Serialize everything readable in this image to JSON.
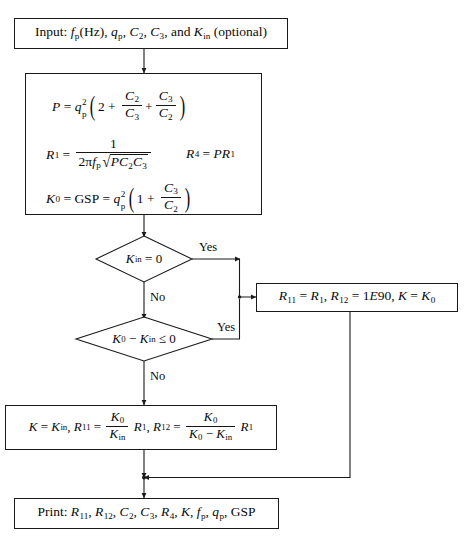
{
  "figure": {
    "type": "flowchart",
    "title_fragment": "",
    "accent_color": "#1a1a1a",
    "background": "#ffffff"
  },
  "nodes": {
    "input": {
      "id": "input-box",
      "shape": "rectangle",
      "text_plain": "Input: fp(Hz), qp, C2, C3, and Kin (optional)",
      "label_prefix": "Input:",
      "parts": [
        "fp(Hz)",
        "qp",
        "C2",
        "C3",
        "and Kin (optional)"
      ]
    },
    "compute": {
      "id": "compute-box",
      "shape": "rectangle",
      "lines": [
        "P = qp^2 ( 2 + C2/C3 + C3/C2 )",
        "R1 = 1 / ( 2 pi fp sqrt(P C2 C3) )",
        "R4 = P R1",
        "K0 = GSP = qp^2 ( 1 + C3/C2 )"
      ]
    },
    "decision1": {
      "id": "decision-kin-zero",
      "shape": "diamond",
      "text_plain": "Kin = 0",
      "yes_label": "Yes",
      "no_label": "No"
    },
    "decision2": {
      "id": "decision-k0-minus-kin",
      "shape": "diamond",
      "text_plain": "K0 - Kin <= 0",
      "yes_label": "Yes",
      "no_label": "No"
    },
    "assign_right": {
      "id": "assign-right-box",
      "shape": "rectangle",
      "text_plain": "R11 = R1, R12 = 1E90, K = K0",
      "constant_value": "1E90"
    },
    "assign_bottom": {
      "id": "assign-bottom-box",
      "shape": "rectangle",
      "text_plain": "K = Kin, R11 = (K0/Kin) R1, R12 = (K0/(K0 - Kin)) R1"
    },
    "print": {
      "id": "print-box",
      "shape": "rectangle",
      "text_plain": "Print: R11, R12, C2, C3, R4, K, fp, qp, GSP",
      "label_prefix": "Print:",
      "items": [
        "R11",
        "R12",
        "C2",
        "C3",
        "R4",
        "K",
        "fp",
        "qp",
        "GSP"
      ]
    }
  },
  "symbols": {
    "P": "P",
    "R1": "R1",
    "R4": "R4",
    "R11": "R11",
    "R12": "R12",
    "K": "K",
    "K0": "K0",
    "Kin": "Kin",
    "C2": "C2",
    "C3": "C3",
    "qp": "qp",
    "fp": "fp",
    "GSP": "GSP",
    "Hz": "Hz",
    "pi": "π",
    "leq": "≤"
  },
  "edges": [
    {
      "from": "input",
      "to": "compute",
      "label": ""
    },
    {
      "from": "compute",
      "to": "decision1",
      "label": ""
    },
    {
      "from": "decision1",
      "to": "assign_right",
      "label": "Yes"
    },
    {
      "from": "decision1",
      "to": "decision2",
      "label": "No"
    },
    {
      "from": "decision2",
      "to": "assign_right",
      "label": "Yes"
    },
    {
      "from": "decision2",
      "to": "assign_bottom",
      "label": "No"
    },
    {
      "from": "assign_bottom",
      "to": "print",
      "label": ""
    },
    {
      "from": "assign_right",
      "to": "print",
      "label": ""
    }
  ]
}
